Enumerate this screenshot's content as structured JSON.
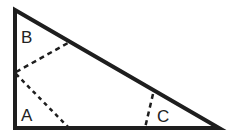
{
  "diagram": {
    "type": "right-triangle-angle-division",
    "labels": {
      "a": "A",
      "b": "B",
      "c": "C"
    },
    "colors": {
      "stroke": "#1e1e1e",
      "background": "#ffffff"
    }
  }
}
